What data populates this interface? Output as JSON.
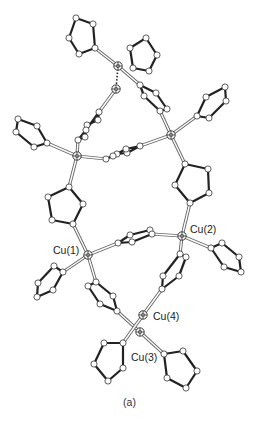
{
  "figure": {
    "panel_label": "(a)",
    "cut_caption_text": "",
    "labels": [
      {
        "id": "cu1",
        "text": "Cu(1)",
        "x": 53,
        "y": 245
      },
      {
        "id": "cu2",
        "text": "Cu(2)",
        "x": 190,
        "y": 224
      },
      {
        "id": "cu3",
        "text": "Cu(3)",
        "x": 131,
        "y": 352
      },
      {
        "id": "cu4",
        "text": "Cu(4)",
        "x": 153,
        "y": 311
      }
    ],
    "colors": {
      "bond_dark": "#222222",
      "bond_light": "#777777",
      "atom_fill": "#ffffff",
      "atom_stroke": "#333333"
    },
    "cu_atoms": [
      {
        "id": "cuTop",
        "x": 118,
        "y": 66
      },
      {
        "id": "cuDash",
        "x": 116,
        "y": 89
      },
      {
        "id": "cuL",
        "x": 77,
        "y": 156
      },
      {
        "id": "cuR",
        "x": 171,
        "y": 135
      },
      {
        "id": "cu1",
        "x": 88,
        "y": 255
      },
      {
        "id": "cu2",
        "x": 182,
        "y": 236
      },
      {
        "id": "cu4",
        "x": 143,
        "y": 315
      },
      {
        "id": "cu3",
        "x": 140,
        "y": 332
      }
    ],
    "rings": [
      [
        [
          76,
          18
        ],
        [
          93,
          24
        ],
        [
          95,
          48
        ],
        [
          79,
          54
        ],
        [
          69,
          38
        ]
      ],
      [
        [
          146,
          38
        ],
        [
          157,
          55
        ],
        [
          149,
          71
        ],
        [
          133,
          68
        ],
        [
          130,
          48
        ]
      ],
      [
        [
          140,
          85
        ],
        [
          156,
          93
        ],
        [
          167,
          109
        ],
        [
          160,
          111
        ],
        [
          144,
          96
        ]
      ],
      [
        [
          197,
          116
        ],
        [
          206,
          97
        ],
        [
          225,
          87
        ],
        [
          226,
          101
        ],
        [
          209,
          118
        ]
      ],
      [
        [
          18,
          119
        ],
        [
          37,
          126
        ],
        [
          47,
          143
        ],
        [
          34,
          147
        ],
        [
          16,
          132
        ]
      ],
      [
        [
          99,
          112
        ],
        [
          98,
          120
        ],
        [
          87,
          125
        ],
        [
          85,
          137
        ],
        [
          78,
          140
        ],
        [
          86,
          130
        ]
      ],
      [
        [
          106,
          159
        ],
        [
          117,
          154
        ],
        [
          127,
          153
        ],
        [
          140,
          146
        ],
        [
          126,
          149
        ],
        [
          113,
          156
        ]
      ],
      [
        [
          69,
          187
        ],
        [
          83,
          204
        ],
        [
          73,
          224
        ],
        [
          52,
          220
        ],
        [
          48,
          197
        ]
      ],
      [
        [
          185,
          164
        ],
        [
          208,
          169
        ],
        [
          209,
          193
        ],
        [
          190,
          203
        ],
        [
          175,
          185
        ]
      ],
      [
        [
          118,
          243
        ],
        [
          130,
          235
        ],
        [
          150,
          230
        ],
        [
          152,
          234
        ],
        [
          132,
          242
        ]
      ],
      [
        [
          211,
          248
        ],
        [
          222,
          243
        ],
        [
          239,
          257
        ],
        [
          241,
          272
        ],
        [
          224,
          267
        ]
      ],
      [
        [
          180,
          254
        ],
        [
          186,
          257
        ],
        [
          179,
          276
        ],
        [
          162,
          289
        ],
        [
          163,
          276
        ]
      ],
      [
        [
          63,
          272
        ],
        [
          54,
          266
        ],
        [
          38,
          283
        ],
        [
          37,
          297
        ],
        [
          53,
          290
        ]
      ],
      [
        [
          96,
          282
        ],
        [
          113,
          296
        ],
        [
          117,
          311
        ],
        [
          100,
          304
        ],
        [
          88,
          286
        ]
      ],
      [
        [
          123,
          343
        ],
        [
          104,
          343
        ],
        [
          94,
          364
        ],
        [
          108,
          381
        ],
        [
          123,
          368
        ]
      ],
      [
        [
          164,
          354
        ],
        [
          183,
          351
        ],
        [
          197,
          371
        ],
        [
          186,
          388
        ],
        [
          167,
          378
        ]
      ]
    ],
    "bonds": [
      [
        95,
        48,
        118,
        66
      ],
      [
        118,
        66,
        140,
        85
      ],
      [
        116,
        89,
        99,
        112
      ],
      [
        78,
        140,
        77,
        156
      ],
      [
        47,
        143,
        77,
        156
      ],
      [
        77,
        156,
        106,
        159
      ],
      [
        77,
        156,
        69,
        187
      ],
      [
        160,
        111,
        171,
        135
      ],
      [
        171,
        135,
        197,
        116
      ],
      [
        171,
        135,
        140,
        146
      ],
      [
        171,
        135,
        185,
        164
      ],
      [
        190,
        203,
        182,
        236
      ],
      [
        73,
        224,
        88,
        255
      ],
      [
        88,
        255,
        118,
        243
      ],
      [
        88,
        255,
        63,
        272
      ],
      [
        88,
        255,
        96,
        282
      ],
      [
        152,
        234,
        182,
        236
      ],
      [
        182,
        236,
        211,
        248
      ],
      [
        182,
        236,
        180,
        254
      ],
      [
        162,
        289,
        143,
        315
      ],
      [
        117,
        311,
        140,
        332
      ],
      [
        143,
        315,
        123,
        343
      ],
      [
        140,
        332,
        164,
        354
      ]
    ],
    "dashed_bonds": [
      [
        118,
        66,
        116,
        89
      ]
    ]
  }
}
